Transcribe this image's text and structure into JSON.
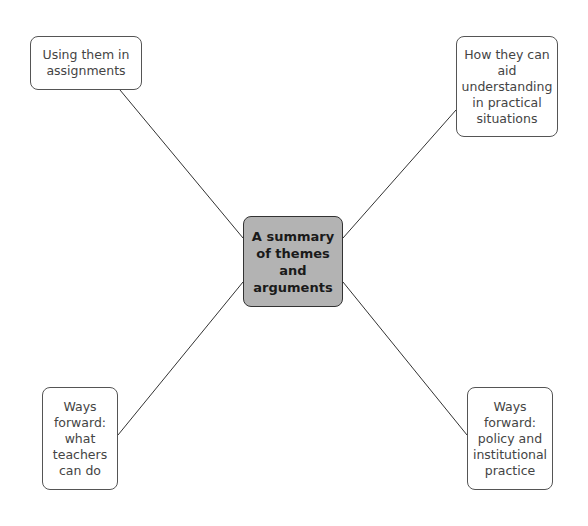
{
  "diagram": {
    "type": "mind-map",
    "center": {
      "label": "A summary of themes and arguments",
      "fill": "#b3b3b3"
    },
    "branches": [
      {
        "id": "top-left",
        "label": "Using them in assignments"
      },
      {
        "id": "top-right",
        "label": "How they can aid understanding in practical situations"
      },
      {
        "id": "bottom-left",
        "label": "Ways forward: what teachers can do"
      },
      {
        "id": "bottom-right",
        "label": "Ways forward: policy and institutional practice"
      }
    ]
  }
}
